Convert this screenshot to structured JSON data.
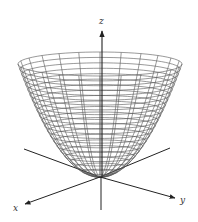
{
  "figure": {
    "surface": {
      "type": "paraboloid",
      "line_color": "#555555",
      "rings": 22,
      "meridians": 24
    },
    "axes": {
      "z_label": "z",
      "x_label": "x",
      "y_label": "y",
      "color": "#222222"
    }
  }
}
